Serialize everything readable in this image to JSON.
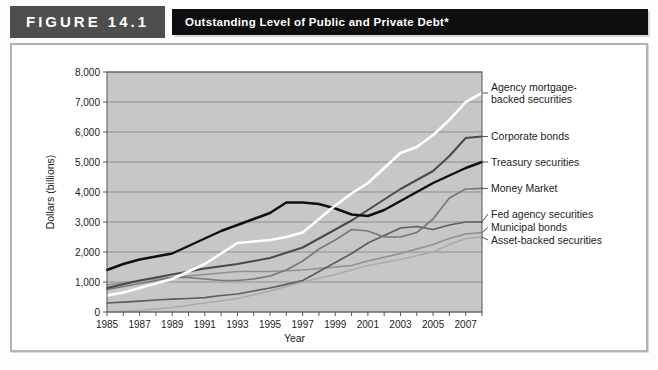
{
  "figure": {
    "label": "FIGURE 14.1",
    "title": "Outstanding Level of Public and Private Debt*"
  },
  "chart_data": {
    "type": "line",
    "title": "Outstanding Level of Public and Private Debt",
    "xlabel": "Year",
    "ylabel": "Dollars (billions)",
    "x_range": [
      1985,
      2008
    ],
    "ylim": [
      0,
      8000
    ],
    "y_tick_step": 1000,
    "grid": true,
    "legend_position": "right",
    "plot_bg": "#c7c7c7",
    "grid_color": "#8f8f8f",
    "axis_color": "#555555",
    "x": [
      1985,
      1986,
      1987,
      1988,
      1989,
      1990,
      1991,
      1992,
      1993,
      1994,
      1995,
      1996,
      1997,
      1998,
      1999,
      2000,
      2001,
      2002,
      2003,
      2004,
      2005,
      2006,
      2007,
      2008
    ],
    "x_tick_labels": [
      "1985",
      "1987",
      "1989",
      "1991",
      "1993",
      "1995",
      "1997",
      "1999",
      "2001",
      "2003",
      "2005",
      "2007"
    ],
    "x_tick_years": [
      1985,
      1987,
      1989,
      1991,
      1993,
      1995,
      1997,
      1999,
      2001,
      2003,
      2005,
      2007
    ],
    "y_tick_labels": [
      "0",
      "1,000",
      "2,000",
      "3,000",
      "4,000",
      "5,000",
      "6,000",
      "7,000",
      "8,000"
    ],
    "series": [
      {
        "name": "Agency mortgage-backed securities",
        "legend_lines": [
          "Agency mortgage-",
          "backed securities"
        ],
        "color": "#ffffff",
        "line_width": 2.6,
        "values": [
          550,
          650,
          800,
          950,
          1100,
          1350,
          1600,
          1950,
          2300,
          2350,
          2400,
          2500,
          2650,
          3100,
          3550,
          3950,
          4300,
          4800,
          5300,
          5500,
          5900,
          6400,
          7000,
          7300
        ]
      },
      {
        "name": "Corporate bonds",
        "legend_lines": [
          "Corporate bonds"
        ],
        "color": "#4a4a4a",
        "line_width": 2.0,
        "values": [
          800,
          925,
          1050,
          1150,
          1250,
          1350,
          1450,
          1525,
          1600,
          1700,
          1800,
          1975,
          2150,
          2450,
          2750,
          3050,
          3400,
          3750,
          4100,
          4400,
          4700,
          5200,
          5800,
          5850
        ]
      },
      {
        "name": "Treasury securities",
        "legend_lines": [
          "Treasury securities"
        ],
        "color": "#101010",
        "line_width": 2.4,
        "values": [
          1400,
          1600,
          1750,
          1850,
          1950,
          2200,
          2450,
          2700,
          2900,
          3100,
          3300,
          3650,
          3650,
          3600,
          3450,
          3250,
          3200,
          3400,
          3700,
          4000,
          4300,
          4550,
          4800,
          5000
        ]
      },
      {
        "name": "Money Market",
        "legend_lines": [
          "Money Market"
        ],
        "color": "#787878",
        "line_width": 1.7,
        "values": [
          750,
          850,
          950,
          1050,
          1150,
          1150,
          1100,
          1050,
          1050,
          1100,
          1200,
          1400,
          1700,
          2100,
          2400,
          2750,
          2700,
          2500,
          2500,
          2650,
          3100,
          3800,
          4100,
          4120
        ]
      },
      {
        "name": "Fed agency securities",
        "legend_lines": [
          "Fed agency securities"
        ],
        "color": "#5e5e5e",
        "line_width": 1.7,
        "values": [
          300,
          330,
          360,
          400,
          430,
          450,
          480,
          550,
          600,
          700,
          800,
          925,
          1050,
          1350,
          1650,
          1950,
          2300,
          2550,
          2800,
          2850,
          2750,
          2900,
          3000,
          3000
        ]
      },
      {
        "name": "Municipal bonds",
        "legend_lines": [
          "Municipal bonds"
        ],
        "color": "#909090",
        "line_width": 1.6,
        "values": [
          900,
          975,
          1050,
          1100,
          1150,
          1200,
          1250,
          1300,
          1350,
          1350,
          1350,
          1375,
          1400,
          1450,
          1500,
          1550,
          1700,
          1825,
          1950,
          2100,
          2250,
          2450,
          2600,
          2650
        ]
      },
      {
        "name": "Asset-backed securities",
        "legend_lines": [
          "Asset-backed securities"
        ],
        "color": "#ababab",
        "line_width": 1.6,
        "values": [
          0,
          25,
          50,
          100,
          150,
          225,
          300,
          375,
          450,
          575,
          700,
          850,
          1000,
          1125,
          1250,
          1400,
          1550,
          1650,
          1750,
          1875,
          2000,
          2250,
          2450,
          2500
        ]
      }
    ]
  }
}
